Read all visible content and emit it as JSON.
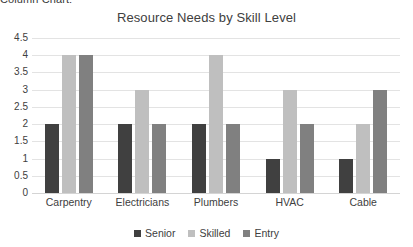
{
  "clipped_caption": "Column Chart:",
  "chart_data": {
    "type": "bar",
    "title": "Resource Needs by Skill Level",
    "xlabel": "",
    "ylabel": "",
    "categories": [
      "Carpentry",
      "Electricians",
      "Plumbers",
      "HVAC",
      "Cable"
    ],
    "series": [
      {
        "name": "Senior",
        "color": "#404040",
        "values": [
          2,
          2,
          2,
          1,
          1
        ]
      },
      {
        "name": "Skilled",
        "color": "#bfbfbf",
        "values": [
          4,
          3,
          4,
          3,
          2
        ]
      },
      {
        "name": "Entry",
        "color": "#808080",
        "values": [
          4,
          2,
          2,
          2,
          3
        ]
      }
    ],
    "ylim": [
      0,
      4.5
    ],
    "ytick_step": 0.5,
    "ytick_labels": [
      "4.5",
      "4",
      "3.5",
      "3",
      "2.5",
      "2",
      "1.5",
      "1",
      "0.5",
      "0"
    ],
    "ytick_values": [
      4.5,
      4,
      3.5,
      3,
      2.5,
      2,
      1.5,
      1,
      0.5,
      0
    ],
    "grid": true,
    "grid_color": "#e3e3e3",
    "legend_position": "bottom",
    "background": "#ffffff",
    "text_color": "#404040"
  }
}
